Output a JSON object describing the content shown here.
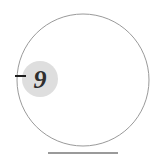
{
  "figure": {
    "background_color": "#ffffff",
    "outer_circle": {
      "name": "outer-circle",
      "center_x": 83,
      "center_y": 80,
      "radius": 66,
      "stroke_color": "#9a9a9a",
      "stroke_width": 1,
      "fill": "none"
    },
    "marker_disc": {
      "name": "marker-disc",
      "center_x": 40,
      "center_y": 79,
      "radius": 18,
      "fill_color": "#dedede",
      "stroke": "none"
    },
    "label": {
      "text": "9",
      "x": 40,
      "y": 88,
      "color": "#2e2e2e",
      "style": "italic-serif-bold",
      "font_size": 26
    },
    "tick_dash": {
      "name": "tick-dash",
      "x1": 15,
      "y1": 76,
      "x2": 26,
      "y2": 76,
      "stroke_color": "#1f1f1f",
      "stroke_width": 2
    },
    "baseline": {
      "name": "baseline-tangent",
      "x1": 48,
      "y1": 153,
      "x2": 118,
      "y2": 153,
      "stroke_color": "#9a9a9a",
      "stroke_width": 2
    }
  }
}
